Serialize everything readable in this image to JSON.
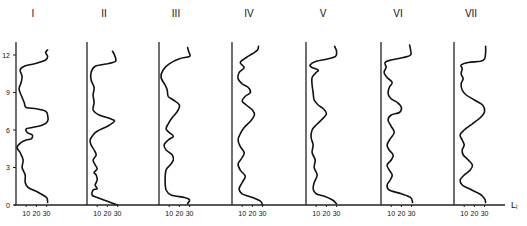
{
  "chart_data": {
    "type": "line",
    "title": "",
    "orientation": "vertical-profiles",
    "xlabel": "Lᵢ",
    "ylabel": "",
    "y_ticks": [
      0,
      3,
      6,
      9,
      12
    ],
    "x_ticks": [
      10,
      20,
      30
    ],
    "ylim": [
      0,
      13
    ],
    "xlim": [
      0,
      35
    ],
    "grid": false,
    "legend": null,
    "panels": [
      {
        "label": "I",
        "points": [
          [
            31,
            0.2
          ],
          [
            30,
            0.6
          ],
          [
            22,
            1.0
          ],
          [
            12,
            1.4
          ],
          [
            9,
            1.8
          ],
          [
            9,
            2.4
          ],
          [
            6,
            3.0
          ],
          [
            7,
            3.6
          ],
          [
            4,
            4.2
          ],
          [
            1,
            4.6
          ],
          [
            5,
            5.0
          ],
          [
            10,
            5.2
          ],
          [
            15,
            5.3
          ],
          [
            16,
            5.6
          ],
          [
            11,
            5.8
          ],
          [
            10,
            6.1
          ],
          [
            16,
            6.2
          ],
          [
            26,
            6.4
          ],
          [
            31,
            6.7
          ],
          [
            31,
            7.2
          ],
          [
            29,
            7.5
          ],
          [
            20,
            7.7
          ],
          [
            10,
            7.8
          ],
          [
            8,
            8.2
          ],
          [
            5,
            8.8
          ],
          [
            3,
            9.3
          ],
          [
            5,
            9.8
          ],
          [
            6,
            10.3
          ],
          [
            4,
            10.8
          ],
          [
            8,
            11.1
          ],
          [
            18,
            11.3
          ],
          [
            29,
            11.6
          ],
          [
            31,
            11.9
          ],
          [
            29,
            12.2
          ],
          [
            31,
            12.4
          ]
        ]
      },
      {
        "label": "II",
        "points": [
          [
            30,
            0.0
          ],
          [
            20,
            0.3
          ],
          [
            10,
            0.6
          ],
          [
            5,
            0.8
          ],
          [
            6,
            1.2
          ],
          [
            10,
            1.3
          ],
          [
            8,
            1.6
          ],
          [
            10,
            2.0
          ],
          [
            9,
            2.4
          ],
          [
            7,
            2.6
          ],
          [
            10,
            2.9
          ],
          [
            8,
            3.2
          ],
          [
            6,
            3.6
          ],
          [
            9,
            4.0
          ],
          [
            7,
            4.4
          ],
          [
            4,
            4.8
          ],
          [
            3,
            5.2
          ],
          [
            6,
            5.6
          ],
          [
            10,
            5.9
          ],
          [
            20,
            6.3
          ],
          [
            27,
            6.7
          ],
          [
            23,
            6.9
          ],
          [
            12,
            7.2
          ],
          [
            6,
            7.6
          ],
          [
            7,
            8.2
          ],
          [
            6,
            8.8
          ],
          [
            7,
            9.4
          ],
          [
            4,
            10.0
          ],
          [
            4,
            10.6
          ],
          [
            8,
            11.1
          ],
          [
            20,
            11.3
          ],
          [
            28,
            11.5
          ],
          [
            27,
            12.0
          ],
          [
            25,
            12.3
          ]
        ]
      },
      {
        "label": "III",
        "points": [
          [
            28,
            0.1
          ],
          [
            30,
            0.4
          ],
          [
            25,
            0.6
          ],
          [
            12,
            0.8
          ],
          [
            7,
            1.2
          ],
          [
            6,
            2.0
          ],
          [
            7,
            2.8
          ],
          [
            11,
            3.2
          ],
          [
            14,
            3.6
          ],
          [
            13,
            4.0
          ],
          [
            7,
            4.4
          ],
          [
            5,
            4.8
          ],
          [
            9,
            5.2
          ],
          [
            14,
            5.5
          ],
          [
            10,
            5.8
          ],
          [
            7,
            6.1
          ],
          [
            9,
            6.5
          ],
          [
            13,
            7.0
          ],
          [
            18,
            7.5
          ],
          [
            20,
            8.0
          ],
          [
            14,
            8.4
          ],
          [
            9,
            8.7
          ],
          [
            8,
            9.2
          ],
          [
            6,
            9.6
          ],
          [
            2,
            10.2
          ],
          [
            4,
            10.8
          ],
          [
            10,
            11.3
          ],
          [
            20,
            11.7
          ],
          [
            30,
            11.9
          ],
          [
            29,
            12.3
          ],
          [
            28,
            12.6
          ]
        ]
      },
      {
        "label": "IV",
        "points": [
          [
            30,
            0.0
          ],
          [
            28,
            0.3
          ],
          [
            20,
            0.6
          ],
          [
            10,
            0.9
          ],
          [
            7,
            1.3
          ],
          [
            10,
            1.8
          ],
          [
            13,
            2.3
          ],
          [
            8,
            2.8
          ],
          [
            6,
            3.3
          ],
          [
            10,
            3.8
          ],
          [
            12,
            4.2
          ],
          [
            8,
            4.7
          ],
          [
            6,
            5.2
          ],
          [
            8,
            5.7
          ],
          [
            12,
            6.2
          ],
          [
            18,
            6.7
          ],
          [
            22,
            7.2
          ],
          [
            20,
            7.6
          ],
          [
            14,
            8.0
          ],
          [
            10,
            8.3
          ],
          [
            13,
            8.7
          ],
          [
            18,
            9.0
          ],
          [
            16,
            9.4
          ],
          [
            10,
            9.7
          ],
          [
            6,
            10.1
          ],
          [
            7,
            10.6
          ],
          [
            12,
            11.0
          ],
          [
            8,
            11.4
          ],
          [
            14,
            11.8
          ],
          [
            20,
            12.1
          ],
          [
            25,
            12.4
          ],
          [
            26,
            12.7
          ]
        ]
      },
      {
        "label": "V",
        "points": [
          [
            30,
            0.1
          ],
          [
            26,
            0.4
          ],
          [
            18,
            0.7
          ],
          [
            10,
            0.9
          ],
          [
            7,
            1.3
          ],
          [
            8,
            1.8
          ],
          [
            11,
            2.4
          ],
          [
            8,
            3.0
          ],
          [
            9,
            3.6
          ],
          [
            6,
            4.2
          ],
          [
            7,
            4.8
          ],
          [
            5,
            5.4
          ],
          [
            6,
            6.0
          ],
          [
            10,
            6.4
          ],
          [
            15,
            6.8
          ],
          [
            20,
            7.3
          ],
          [
            17,
            7.7
          ],
          [
            12,
            8.0
          ],
          [
            8,
            8.4
          ],
          [
            7,
            9.0
          ],
          [
            6,
            9.6
          ],
          [
            6,
            10.2
          ],
          [
            10,
            10.6
          ],
          [
            12,
            10.8
          ],
          [
            6,
            11.0
          ],
          [
            4,
            11.2
          ],
          [
            10,
            11.5
          ],
          [
            22,
            11.7
          ],
          [
            29,
            11.9
          ],
          [
            30,
            12.3
          ],
          [
            28,
            12.7
          ]
        ]
      },
      {
        "label": "VI",
        "points": [
          [
            31,
            0.2
          ],
          [
            29,
            0.6
          ],
          [
            20,
            0.9
          ],
          [
            8,
            1.2
          ],
          [
            6,
            1.6
          ],
          [
            9,
            2.0
          ],
          [
            11,
            2.4
          ],
          [
            8,
            2.8
          ],
          [
            6,
            3.2
          ],
          [
            10,
            3.6
          ],
          [
            12,
            4.0
          ],
          [
            8,
            4.4
          ],
          [
            6,
            4.8
          ],
          [
            9,
            5.3
          ],
          [
            13,
            5.8
          ],
          [
            10,
            6.3
          ],
          [
            7,
            6.8
          ],
          [
            10,
            7.2
          ],
          [
            18,
            7.4
          ],
          [
            20,
            7.8
          ],
          [
            16,
            8.2
          ],
          [
            10,
            8.5
          ],
          [
            7,
            8.9
          ],
          [
            8,
            9.4
          ],
          [
            11,
            9.8
          ],
          [
            6,
            10.2
          ],
          [
            3,
            10.6
          ],
          [
            5,
            11.0
          ],
          [
            4,
            11.4
          ],
          [
            10,
            11.6
          ],
          [
            22,
            11.8
          ],
          [
            29,
            12.0
          ],
          [
            29,
            12.4
          ],
          [
            28,
            12.8
          ]
        ]
      },
      {
        "label": "VII",
        "points": [
          [
            31,
            0.2
          ],
          [
            30,
            0.5
          ],
          [
            25,
            0.9
          ],
          [
            15,
            1.3
          ],
          [
            8,
            1.6
          ],
          [
            6,
            2.0
          ],
          [
            10,
            2.4
          ],
          [
            16,
            2.8
          ],
          [
            18,
            3.2
          ],
          [
            14,
            3.6
          ],
          [
            9,
            4.0
          ],
          [
            8,
            4.4
          ],
          [
            10,
            4.8
          ],
          [
            8,
            5.2
          ],
          [
            6,
            5.6
          ],
          [
            10,
            6.0
          ],
          [
            18,
            6.5
          ],
          [
            26,
            7.0
          ],
          [
            30,
            7.5
          ],
          [
            28,
            8.0
          ],
          [
            20,
            8.4
          ],
          [
            12,
            8.8
          ],
          [
            8,
            9.2
          ],
          [
            7,
            9.7
          ],
          [
            9,
            10.1
          ],
          [
            7,
            10.5
          ],
          [
            8,
            10.9
          ],
          [
            7,
            11.2
          ],
          [
            14,
            11.4
          ],
          [
            26,
            11.5
          ],
          [
            30,
            11.7
          ],
          [
            31,
            12.2
          ],
          [
            31,
            12.7
          ]
        ]
      }
    ]
  },
  "labels": {
    "panels": [
      "I",
      "II",
      "III",
      "IV",
      "V",
      "VI",
      "VII"
    ],
    "y_ticks": [
      "0",
      "3",
      "6",
      "9",
      "12"
    ],
    "x_ticks": [
      "10",
      "20",
      "30"
    ],
    "x_axis_symbol": "Lᵢ"
  }
}
